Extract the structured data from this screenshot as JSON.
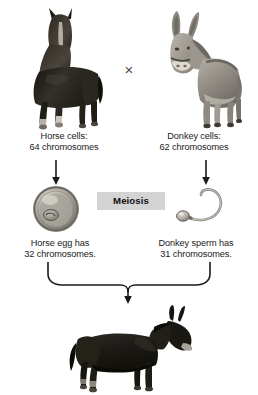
{
  "diagram": {
    "cross_symbol": "×",
    "parents": {
      "left": {
        "organism": "horse",
        "caption_line1": "Horse cells:",
        "caption_line2": "64 chromosomes"
      },
      "right": {
        "organism": "donkey",
        "caption_line1": "Donkey cells:",
        "caption_line2": "62 chromosomes"
      }
    },
    "process": {
      "label": "Meiosis"
    },
    "gametes": {
      "left": {
        "cell_type": "egg",
        "caption_line1": "Horse egg has",
        "caption_line2": "32 chromosomes."
      },
      "right": {
        "cell_type": "sperm",
        "caption_line1": "Donkey sperm has",
        "caption_line2": "31 chromosomes."
      }
    },
    "offspring": {
      "organism": "mule"
    },
    "colors": {
      "background": "#ffffff",
      "text": "#1b1b1b",
      "arrow": "#1a1a1a",
      "process_box": "#d4d4d4",
      "horse": "#2b2926",
      "donkey": "#9a968f",
      "mule": "#20201e",
      "egg": "#9d9a94",
      "sperm": "#a5a19b"
    }
  }
}
